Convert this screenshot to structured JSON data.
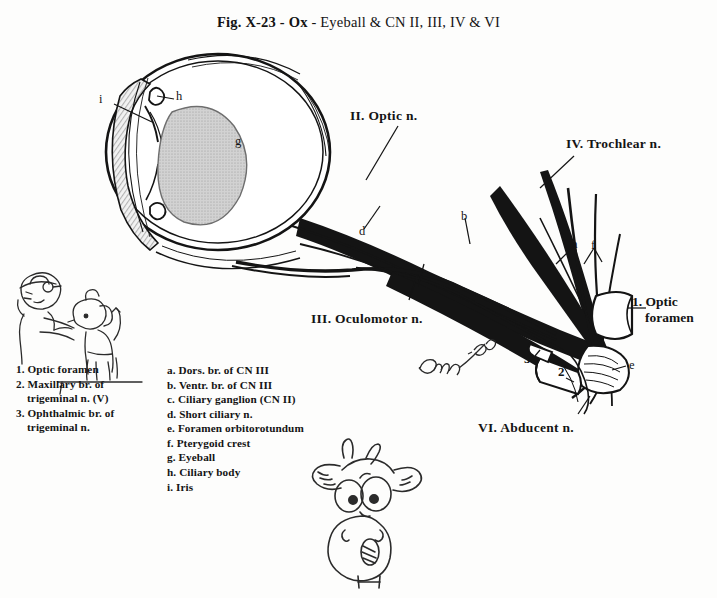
{
  "figure": {
    "title_bold_1": "Fig. X-23 - Ox",
    "title_sep": " - ",
    "title_rest": "Eyeball & CN II, III, IV & VI",
    "signature": "Pasquini '80",
    "ink_color": "#141414",
    "paper_color": "#fdfdfc",
    "lens_fill": "#c9c9c9"
  },
  "nerve_labels": {
    "optic": "II. Optic n.",
    "oculomotor": "III. Oculomotor n.",
    "trochlear": "IV. Trochlear n.",
    "abducent": "VI. Abducent n."
  },
  "callouts": {
    "optic_foramen_line1": "1. Optic",
    "optic_foramen_line2": "foramen"
  },
  "letter_markers": {
    "a": "a",
    "b": "b",
    "c": "c",
    "d": "d",
    "e": "e",
    "f": "f",
    "g": "g",
    "h": "h",
    "i": "i"
  },
  "number_markers": {
    "n2": "2",
    "n3": "3"
  },
  "legend_numbers": [
    {
      "key": "1.",
      "line1": "Optic foramen",
      "line2": ""
    },
    {
      "key": "2.",
      "line1": "Maxillary br. of",
      "line2": "trigeminal n. (V)"
    },
    {
      "key": "3.",
      "line1": "Ophthalmic br. of",
      "line2": "trigeminal n."
    }
  ],
  "legend_letters": [
    {
      "key": "a.",
      "text": "Dors. br. of CN III"
    },
    {
      "key": "b.",
      "text": "Ventr. br. of CN III"
    },
    {
      "key": "c.",
      "text": "Ciliary ganglion (CN II)"
    },
    {
      "key": "d.",
      "text": "Short ciliary n."
    },
    {
      "key": "e.",
      "text": "Foramen orbitorotundum"
    },
    {
      "key": "f.",
      "text": "Pterygoid crest"
    },
    {
      "key": "g.",
      "text": "Eyeball"
    },
    {
      "key": "h.",
      "text": "Ciliary body"
    },
    {
      "key": "i.",
      "text": "Iris"
    }
  ],
  "cartoons": {
    "vet_with_dog": "vet-examining-dog-eye-cartoon",
    "ox_head": "ox-head-cartoon"
  }
}
